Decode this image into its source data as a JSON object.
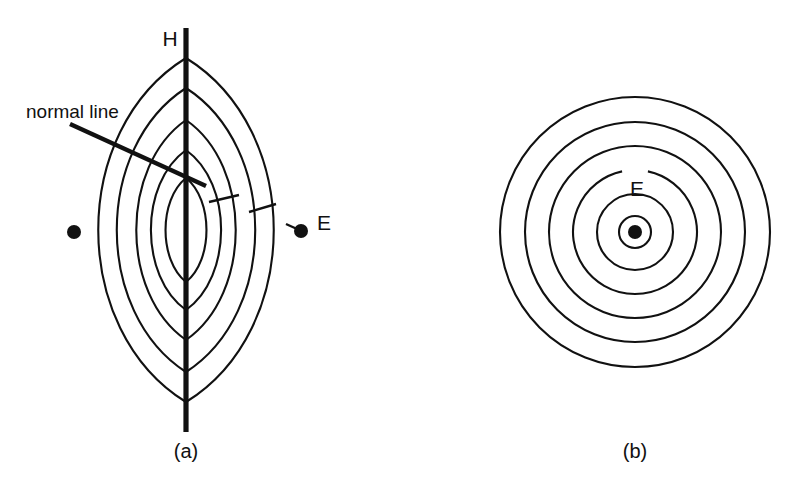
{
  "figure": {
    "background_color": "#ffffff",
    "ink_color": "#111111",
    "width": 801,
    "height": 492
  },
  "panel_a": {
    "caption": "(a)",
    "caption_x": 186,
    "caption_y": 458,
    "center_x": 186,
    "center_y": 230,
    "axis_label": "H",
    "axis_label_x": 170,
    "axis_label_y": 46,
    "axis_line": {
      "x": 186,
      "y_top": 28,
      "y_bottom": 432,
      "width": 5.2
    },
    "note_label": "normal line",
    "note_label_x": 26,
    "note_label_y": 118,
    "leader_line": {
      "x1": 70,
      "y1": 124,
      "x2": 206,
      "y2": 186,
      "width": 4.4
    },
    "dashes": [
      {
        "x1": 209,
        "y1": 202,
        "x2": 239,
        "y2": 195
      },
      {
        "x1": 249,
        "y1": 212,
        "x2": 276,
        "y2": 204
      }
    ],
    "right_dot": {
      "cx": 301,
      "cy": 231,
      "r": 7,
      "label": "E",
      "label_x": 317,
      "label_y": 230
    },
    "right_dot_tick": {
      "x1": 286,
      "y1": 224,
      "x2": 297,
      "y2": 229
    },
    "left_dot": {
      "cx": 74,
      "cy": 232,
      "r": 7
    },
    "lens_contours": [
      {
        "half_width": 90,
        "top_y": 58,
        "bottom_y": 402,
        "index": 1
      },
      {
        "half_width": 71,
        "top_y": 88,
        "bottom_y": 372,
        "index": 2
      },
      {
        "half_width": 51,
        "top_y": 120,
        "bottom_y": 340,
        "index": 3
      },
      {
        "half_width": 36,
        "top_y": 150,
        "bottom_y": 310,
        "index": 4
      },
      {
        "half_width": 21,
        "top_y": 178,
        "bottom_y": 282,
        "index": 5
      }
    ],
    "contour_count": 5
  },
  "panel_b": {
    "caption": "(b)",
    "caption_x": 635,
    "caption_y": 458,
    "center_x": 635,
    "center_y": 232,
    "center_dot": {
      "cx": 635,
      "cy": 232,
      "r": 7
    },
    "label": "E",
    "label_x": 637,
    "label_y": 196,
    "circles": [
      {
        "radius": 135,
        "index": 1
      },
      {
        "radius": 110,
        "index": 2
      },
      {
        "radius": 86,
        "index": 3
      },
      {
        "radius": 62,
        "index": 4
      },
      {
        "radius": 38,
        "index": 5
      },
      {
        "radius": 16,
        "index": 6
      }
    ],
    "circle_count": 6
  },
  "chart_data": {
    "type": "line",
    "title": "",
    "subtitle": "",
    "xlabel": "",
    "ylabel": "",
    "annotations": [
      "H",
      "normal line",
      "E",
      "E",
      "(a)",
      "(b)"
    ],
    "series": [
      {
        "name": "panel-a-lens-contours",
        "description": "Five nested lens (vesica) shaped equal-field contours about a vertical H axis",
        "values": [
          90,
          71,
          51,
          36,
          21
        ]
      },
      {
        "name": "panel-b-circular-contours",
        "description": "Six concentric circular equal-field contours about point source E",
        "values": [
          135,
          110,
          86,
          62,
          38,
          16
        ]
      }
    ],
    "legend_position": "none",
    "grid": false
  }
}
